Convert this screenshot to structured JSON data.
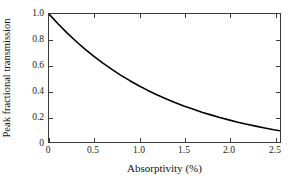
{
  "chart_data": {
    "type": "line",
    "title": "",
    "subtitle": "",
    "xlabel": "Absorptivity (%)",
    "ylabel": "Peak fractional transmission",
    "xlim": [
      0,
      2.57
    ],
    "ylim": [
      0,
      1.0
    ],
    "grid": false,
    "legend": null,
    "legend_position": "none",
    "xticks": [
      0,
      0.5,
      1.0,
      1.5,
      2.0,
      2.5
    ],
    "xticklabels": [
      "0",
      "0.5",
      "1.0",
      "1.5",
      "2.0",
      "2.5"
    ],
    "yticks": [
      0,
      0.2,
      0.4,
      0.6,
      0.8,
      1.0
    ],
    "yticklabels": [
      "0",
      "0.2",
      "0.4",
      "0.6",
      "0.8",
      "1.0"
    ],
    "series": [
      {
        "name": "Peak fractional transmission",
        "color": "#000000",
        "linewidth": 1.6,
        "x": [
          0.0,
          0.1,
          0.2,
          0.3,
          0.4,
          0.5,
          0.6,
          0.7,
          0.8,
          0.9,
          1.0,
          1.1,
          1.2,
          1.3,
          1.4,
          1.5,
          1.6,
          1.7,
          1.8,
          1.9,
          2.0,
          2.1,
          2.2,
          2.3,
          2.4,
          2.5,
          2.57
        ],
        "y": [
          1.0,
          0.924,
          0.853,
          0.787,
          0.726,
          0.669,
          0.616,
          0.567,
          0.521,
          0.479,
          0.44,
          0.403,
          0.369,
          0.338,
          0.309,
          0.282,
          0.257,
          0.233,
          0.212,
          0.191,
          0.173,
          0.155,
          0.139,
          0.124,
          0.11,
          0.096,
          0.088
        ]
      }
    ],
    "annotations": []
  },
  "axes": {
    "box_color": "#3a3a3a",
    "tick_color": "#3a3a3a",
    "background": "#ffffff"
  }
}
